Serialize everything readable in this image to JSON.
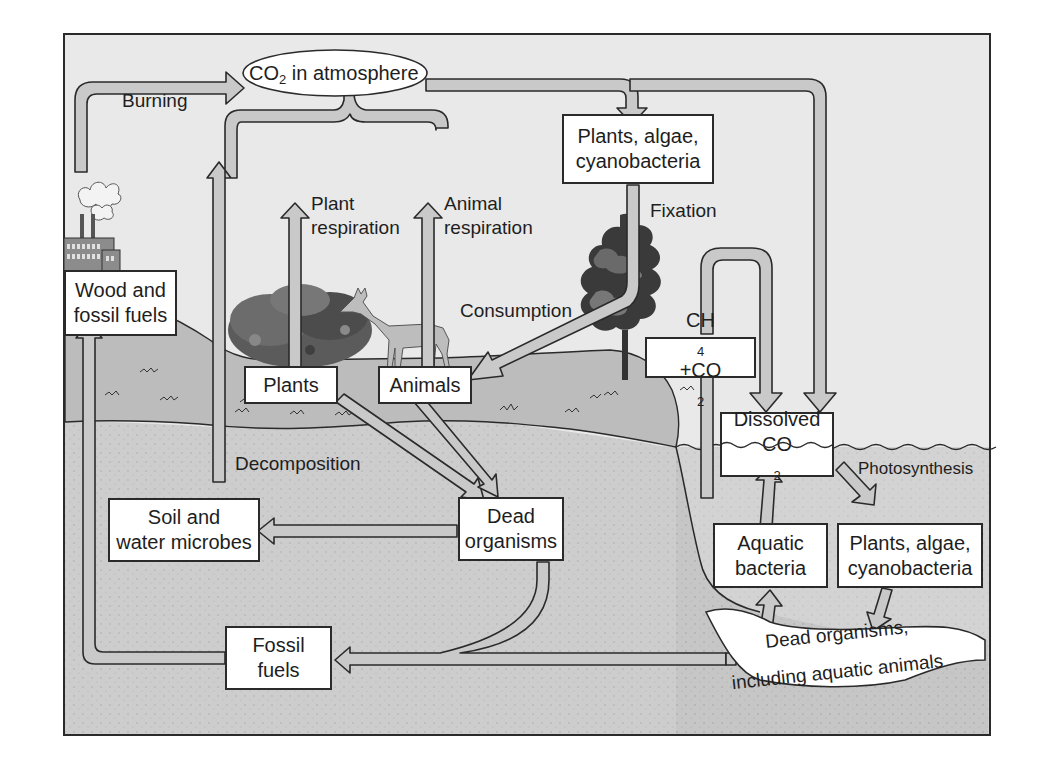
{
  "diagram": {
    "colors": {
      "sky": "#e9e9e9",
      "land_surface": "#bdbdbd",
      "soil": "#cdcdcd",
      "water": "#d4d4d4",
      "arrow_fill": "#c9c9c9",
      "stroke": "#2a2a2a",
      "box_fill": "#ffffff"
    },
    "nodes": {
      "atmosphere": {
        "prefix": "CO",
        "sub": "2",
        "suffix": " in atmosphere"
      },
      "producers_top": {
        "line1": "Plants, algae,",
        "line2": "cyanobacteria"
      },
      "wood_fossil": {
        "line1": "Wood and",
        "line2": "fossil fuels"
      },
      "plants": {
        "label": "Plants"
      },
      "animals": {
        "label": "Animals"
      },
      "methane": {
        "a": "CH",
        "a_sub": "4",
        "b": " +CO",
        "b_sub": "2"
      },
      "dissolved": {
        "line1": "Dissolved",
        "line2_prefix": "CO",
        "line2_sub": "2"
      },
      "soil_microbes": {
        "line1": "Soil and",
        "line2": "water microbes"
      },
      "dead_organisms": {
        "line1": "Dead",
        "line2": "organisms"
      },
      "aquatic_bacteria": {
        "line1": "Aquatic",
        "line2": "bacteria"
      },
      "producers_aquatic": {
        "line1": "Plants, algae,",
        "line2": "cyanobacteria"
      },
      "fossil_fuels": {
        "line1": "Fossil",
        "line2": "fuels"
      },
      "dead_aquatic": {
        "line1": "Dead organisms,",
        "line2": "including aquatic animals"
      }
    },
    "process_labels": {
      "burning": "Burning",
      "plant_respiration_1": "Plant",
      "plant_respiration_2": "respiration",
      "animal_respiration_1": "Animal",
      "animal_respiration_2": "respiration",
      "fixation": "Fixation",
      "consumption": "Consumption",
      "decomposition": "Decomposition",
      "photosynthesis": "Photosynthesis"
    },
    "illustrations": [
      "factory-icon",
      "shrub-icon",
      "deer-icon",
      "tree-icon",
      "water-wave-line"
    ]
  }
}
